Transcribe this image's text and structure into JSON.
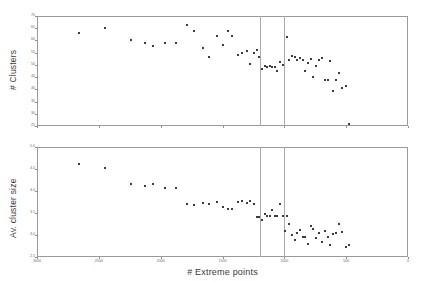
{
  "figure": {
    "background": "#ffffff",
    "dot_color": "#3b3b45",
    "axis_color": "#9a9a9a",
    "vline_color": "#a9a9a9"
  },
  "chart_data": [
    {
      "type": "scatter",
      "title": "",
      "xlabel": "",
      "ylabel": "# Clusters",
      "xlim": [
        3000,
        0
      ],
      "ylim": [
        25,
        70
      ],
      "x_reversed": true,
      "grid": false,
      "legend": null,
      "yticks": [
        25,
        30,
        35,
        40,
        45,
        50,
        55,
        60,
        65,
        70
      ],
      "ytick_labels": [
        "25",
        "30",
        "35",
        "40",
        "45",
        "50",
        "55",
        "60",
        "65",
        "70"
      ],
      "xticks": [
        3000,
        2500,
        2000,
        1500,
        1000,
        500,
        0
      ],
      "xtick_labels": [
        "3000",
        "2500",
        "2000",
        "1500",
        "1000",
        "500",
        "0"
      ],
      "xtick_labels_visible": false,
      "annotations": [
        {
          "type": "vline",
          "x": 1200
        },
        {
          "type": "vline",
          "x": 1000
        }
      ],
      "points": [
        {
          "x": 2660,
          "y": 63.0
        },
        {
          "x": 2450,
          "y": 65.2
        },
        {
          "x": 2240,
          "y": 60.0
        },
        {
          "x": 2130,
          "y": 59.0
        },
        {
          "x": 2065,
          "y": 57.8
        },
        {
          "x": 1965,
          "y": 59.0
        },
        {
          "x": 1880,
          "y": 59.0
        },
        {
          "x": 1790,
          "y": 66.5
        },
        {
          "x": 1730,
          "y": 64.0
        },
        {
          "x": 1660,
          "y": 57.0
        },
        {
          "x": 1610,
          "y": 53.2
        },
        {
          "x": 1545,
          "y": 62.0
        },
        {
          "x": 1495,
          "y": 58.0
        },
        {
          "x": 1455,
          "y": 64.0
        },
        {
          "x": 1425,
          "y": 62.0
        },
        {
          "x": 1375,
          "y": 54.2
        },
        {
          "x": 1340,
          "y": 55.0
        },
        {
          "x": 1305,
          "y": 55.6
        },
        {
          "x": 1275,
          "y": 50.5
        },
        {
          "x": 1248,
          "y": 55.0
        },
        {
          "x": 1222,
          "y": 56.0
        },
        {
          "x": 1205,
          "y": 53.2
        },
        {
          "x": 1178,
          "y": 48.2
        },
        {
          "x": 1158,
          "y": 49.5
        },
        {
          "x": 1138,
          "y": 49.0
        },
        {
          "x": 1118,
          "y": 49.6
        },
        {
          "x": 1098,
          "y": 49.2
        },
        {
          "x": 1078,
          "y": 49.0
        },
        {
          "x": 1060,
          "y": 47.6
        },
        {
          "x": 1035,
          "y": 51.2
        },
        {
          "x": 1012,
          "y": 49.8
        },
        {
          "x": 978,
          "y": 61.5
        },
        {
          "x": 960,
          "y": 52.0
        },
        {
          "x": 935,
          "y": 53.5
        },
        {
          "x": 915,
          "y": 53.2
        },
        {
          "x": 895,
          "y": 51.8
        },
        {
          "x": 872,
          "y": 53.0
        },
        {
          "x": 852,
          "y": 52.2
        },
        {
          "x": 832,
          "y": 47.5
        },
        {
          "x": 808,
          "y": 50.8
        },
        {
          "x": 788,
          "y": 52.5
        },
        {
          "x": 765,
          "y": 45.2
        },
        {
          "x": 742,
          "y": 49.5
        },
        {
          "x": 718,
          "y": 52.0
        },
        {
          "x": 695,
          "y": 53.0
        },
        {
          "x": 672,
          "y": 43.8
        },
        {
          "x": 650,
          "y": 44.0
        },
        {
          "x": 628,
          "y": 51.5
        },
        {
          "x": 605,
          "y": 39.5
        },
        {
          "x": 580,
          "y": 44.0
        },
        {
          "x": 558,
          "y": 46.5
        },
        {
          "x": 532,
          "y": 40.5
        },
        {
          "x": 505,
          "y": 41.5
        },
        {
          "x": 478,
          "y": 26.0
        }
      ]
    },
    {
      "type": "scatter",
      "title": "",
      "xlabel": "# Extreme points",
      "ylabel": "Av. cluster size",
      "xlim": [
        3000,
        0
      ],
      "ylim": [
        2.5,
        5.0
      ],
      "x_reversed": true,
      "grid": false,
      "legend": null,
      "yticks": [
        2.5,
        3.0,
        3.5,
        4.0,
        4.5,
        5.0
      ],
      "ytick_labels": [
        "2.5",
        "3.0",
        "3.5",
        "4.0",
        "4.5",
        "5.0"
      ],
      "xticks": [
        3000,
        2500,
        2000,
        1500,
        1000,
        500,
        0
      ],
      "xtick_labels": [
        "3000",
        "2500",
        "2000",
        "1500",
        "1000",
        "500",
        "0"
      ],
      "xtick_labels_visible": true,
      "annotations": [
        {
          "type": "vline",
          "x": 1200
        },
        {
          "type": "vline",
          "x": 1000
        }
      ],
      "points": [
        {
          "x": 2660,
          "y": 4.62
        },
        {
          "x": 2450,
          "y": 4.53
        },
        {
          "x": 2240,
          "y": 4.17
        },
        {
          "x": 2130,
          "y": 4.11
        },
        {
          "x": 2065,
          "y": 4.17
        },
        {
          "x": 1965,
          "y": 4.06
        },
        {
          "x": 1880,
          "y": 4.06
        },
        {
          "x": 1790,
          "y": 3.7
        },
        {
          "x": 1730,
          "y": 3.69
        },
        {
          "x": 1660,
          "y": 3.72
        },
        {
          "x": 1610,
          "y": 3.7
        },
        {
          "x": 1545,
          "y": 3.74
        },
        {
          "x": 1495,
          "y": 3.64
        },
        {
          "x": 1455,
          "y": 3.6
        },
        {
          "x": 1425,
          "y": 3.6
        },
        {
          "x": 1375,
          "y": 3.74
        },
        {
          "x": 1340,
          "y": 3.78
        },
        {
          "x": 1305,
          "y": 3.72
        },
        {
          "x": 1275,
          "y": 3.78
        },
        {
          "x": 1248,
          "y": 3.7
        },
        {
          "x": 1222,
          "y": 3.42
        },
        {
          "x": 1205,
          "y": 3.4
        },
        {
          "x": 1178,
          "y": 3.34
        },
        {
          "x": 1158,
          "y": 3.47
        },
        {
          "x": 1138,
          "y": 3.44
        },
        {
          "x": 1118,
          "y": 3.43
        },
        {
          "x": 1098,
          "y": 3.57
        },
        {
          "x": 1078,
          "y": 3.44
        },
        {
          "x": 1060,
          "y": 3.44
        },
        {
          "x": 1035,
          "y": 3.7
        },
        {
          "x": 1012,
          "y": 3.44
        },
        {
          "x": 995,
          "y": 3.1
        },
        {
          "x": 978,
          "y": 3.44
        },
        {
          "x": 960,
          "y": 3.25
        },
        {
          "x": 935,
          "y": 3.01
        },
        {
          "x": 915,
          "y": 2.88
        },
        {
          "x": 895,
          "y": 3.04
        },
        {
          "x": 872,
          "y": 3.12
        },
        {
          "x": 852,
          "y": 2.96
        },
        {
          "x": 832,
          "y": 2.95
        },
        {
          "x": 808,
          "y": 2.79
        },
        {
          "x": 788,
          "y": 3.2
        },
        {
          "x": 765,
          "y": 3.14
        },
        {
          "x": 742,
          "y": 2.94
        },
        {
          "x": 718,
          "y": 3.04
        },
        {
          "x": 695,
          "y": 2.85
        },
        {
          "x": 672,
          "y": 3.08
        },
        {
          "x": 650,
          "y": 2.95
        },
        {
          "x": 628,
          "y": 2.78
        },
        {
          "x": 605,
          "y": 3.02
        },
        {
          "x": 580,
          "y": 3.05
        },
        {
          "x": 558,
          "y": 3.25
        },
        {
          "x": 532,
          "y": 3.07
        },
        {
          "x": 505,
          "y": 2.72
        },
        {
          "x": 478,
          "y": 2.78
        }
      ]
    }
  ]
}
